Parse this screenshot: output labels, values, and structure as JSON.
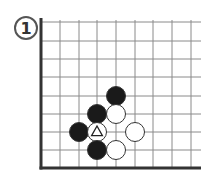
{
  "diagram": {
    "label": "1",
    "board": {
      "columns_x": [
        41,
        60,
        79,
        97,
        116,
        135,
        153,
        172,
        191
      ],
      "rows_y": [
        22,
        41,
        59,
        77,
        96,
        114,
        132,
        150,
        168
      ],
      "right_end": 201,
      "left_edge": "thick",
      "bottom_edge": "thick",
      "line_color": "#8a8a8a",
      "edge_color": "#333333"
    },
    "stones": [
      {
        "color": "black",
        "col": 4,
        "row": 4
      },
      {
        "color": "black",
        "col": 3,
        "row": 5
      },
      {
        "color": "white",
        "col": 4,
        "row": 5
      },
      {
        "color": "black",
        "col": 2,
        "row": 6
      },
      {
        "color": "white",
        "col": 3,
        "row": 6,
        "marker": "triangle"
      },
      {
        "color": "white",
        "col": 5,
        "row": 6
      },
      {
        "color": "black",
        "col": 3,
        "row": 7
      },
      {
        "color": "white",
        "col": 4,
        "row": 7
      }
    ],
    "stone_radius": 9.5,
    "colors": {
      "black": "#1a1a1a",
      "white": "#ffffff",
      "stroke": "#333333"
    }
  }
}
